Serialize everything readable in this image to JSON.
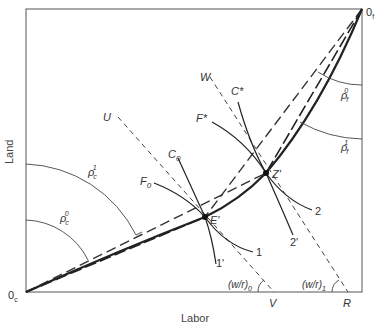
{
  "diagram": {
    "type": "edgeworth-box",
    "x_axis_title": "Labor",
    "y_axis_title": "Land",
    "origins": {
      "clothing": {
        "base": "0",
        "sub": "c"
      },
      "food": {
        "base": "0",
        "sub": "f"
      }
    },
    "points": {
      "E": "E'",
      "Z": "Z'"
    },
    "isoquants": {
      "C0": {
        "base": "C",
        "sub": "0"
      },
      "F0": {
        "base": "F",
        "sub": "0"
      },
      "Cstar": "C*",
      "Fstar": "F*",
      "one": "1",
      "one_prime": "1'",
      "two": "2",
      "two_prime": "2'"
    },
    "price_lines": {
      "U": "U",
      "W": "W",
      "V": "V",
      "R": "R",
      "wr0": {
        "base": "(w/r)",
        "sub": "0"
      },
      "wr1": {
        "base": "(w/r)",
        "sub": "1"
      }
    },
    "angles": {
      "rho_c0": {
        "base": "ρ",
        "sub": "c",
        "sup": "0"
      },
      "rho_c1": {
        "base": "ρ",
        "sub": "c",
        "sup": "1"
      },
      "rho_f0": {
        "base": "ρ",
        "sub": "f",
        "sup": "0"
      },
      "rho_f1": {
        "base": "ρ",
        "sub": "f",
        "sup": "1"
      }
    },
    "colors": {
      "line": "#2a2a2a",
      "dash": "#3a3a3a",
      "box": "#555555"
    }
  }
}
